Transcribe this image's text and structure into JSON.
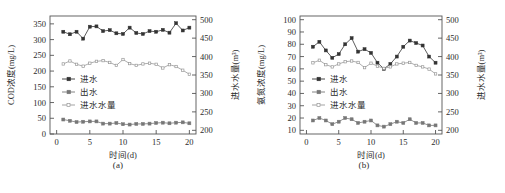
{
  "figure": {
    "panels": [
      {
        "caption": "(a)",
        "x_axis": {
          "label": "时间(d)",
          "ticks": [
            0,
            5,
            10,
            15,
            20
          ],
          "min": -1,
          "max": 21
        },
        "y_axis_left": {
          "label": "COD浓度(mg/L)",
          "ticks": [
            0,
            50,
            100,
            150,
            200,
            250,
            300,
            350
          ],
          "min": 0,
          "max": 375
        },
        "y_axis_right": {
          "label": "进水水量(m³)",
          "ticks": [
            200,
            250,
            300,
            350,
            400,
            450,
            500
          ],
          "min": 190,
          "max": 510
        },
        "legend": [
          {
            "label": "进水",
            "marker": "filled-square",
            "color": "#333333"
          },
          {
            "label": "出水",
            "marker": "filled-square",
            "color": "#777777"
          },
          {
            "label": "进水水量",
            "marker": "line-marker",
            "color": "#999999"
          }
        ],
        "chart_data": {
          "type": "line",
          "title": "",
          "xlabel": "时间(d)",
          "ylabel": "COD浓度(mg/L)",
          "ylabel_right": "进水水量(m³)",
          "xlim": [
            -1,
            21
          ],
          "ylim": [
            0,
            375
          ],
          "ylim_right": [
            190,
            510
          ],
          "grid": false,
          "legend_position": "center-left",
          "x": [
            1,
            2,
            3,
            4,
            5,
            6,
            7,
            8,
            9,
            10,
            11,
            12,
            13,
            14,
            15,
            16,
            17,
            18,
            19,
            20
          ],
          "series": [
            {
              "name": "进水",
              "axis": "left",
              "unit": "mg/L",
              "color": "#333333",
              "values": [
                325,
                317,
                325,
                303,
                341,
                342,
                327,
                330,
                320,
                318,
                338,
                321,
                318,
                327,
                325,
                331,
                322,
                352,
                329,
                338
              ]
            },
            {
              "name": "出水",
              "axis": "left",
              "unit": "mg/L",
              "color": "#777777",
              "values": [
                46,
                42,
                38,
                39,
                40,
                40,
                33,
                33,
                35,
                31,
                30,
                32,
                32,
                33,
                35,
                36,
                34,
                36,
                37,
                34
              ]
            },
            {
              "name": "进水水量",
              "axis": "right",
              "unit": "m³",
              "color": "#999999",
              "values": [
                380,
                388,
                379,
                374,
                382,
                387,
                389,
                384,
                376,
                392,
                381,
                376,
                380,
                382,
                379,
                369,
                378,
                373,
                363,
                352
              ]
            }
          ]
        }
      },
      {
        "caption": "(b)",
        "x_axis": {
          "label": "时间(d)",
          "ticks": [
            0,
            5,
            10,
            15,
            20
          ],
          "min": -1,
          "max": 21
        },
        "y_axis_left": {
          "label": "氨氮浓度(mg/L)",
          "ticks": [
            10,
            20,
            30,
            40,
            50,
            60,
            70,
            80,
            90,
            100
          ],
          "min": 7,
          "max": 103
        },
        "y_axis_right": {
          "label": "进水水量(m³)",
          "ticks": [
            200,
            250,
            300,
            350,
            400,
            450,
            500
          ],
          "min": 190,
          "max": 510
        },
        "legend": [
          {
            "label": "进水",
            "marker": "filled-square",
            "color": "#333333"
          },
          {
            "label": "出水",
            "marker": "filled-square",
            "color": "#777777"
          },
          {
            "label": "进水水量",
            "marker": "line-marker",
            "color": "#999999"
          }
        ],
        "chart_data": {
          "type": "line",
          "title": "",
          "xlabel": "时间(d)",
          "ylabel": "氨氮浓度(mg/L)",
          "ylabel_right": "进水水量(m³)",
          "xlim": [
            -1,
            21
          ],
          "ylim": [
            7,
            103
          ],
          "ylim_right": [
            190,
            510
          ],
          "grid": false,
          "legend_position": "center-left",
          "x": [
            1,
            2,
            3,
            4,
            5,
            6,
            7,
            8,
            9,
            10,
            11,
            12,
            13,
            14,
            15,
            16,
            17,
            18,
            19,
            20
          ],
          "series": [
            {
              "name": "进水",
              "axis": "left",
              "unit": "mg/L",
              "color": "#333333",
              "values": [
                78,
                82,
                75,
                69,
                72,
                80,
                85,
                74,
                76,
                73,
                65,
                60,
                64,
                70,
                78,
                83,
                81,
                79,
                70,
                65
              ]
            },
            {
              "name": "出水",
              "axis": "left",
              "unit": "mg/L",
              "color": "#777777",
              "values": [
                18,
                20,
                18,
                15,
                17,
                20,
                19,
                16,
                17,
                18,
                14,
                13,
                15,
                17,
                16,
                19,
                16,
                16,
                14,
                14
              ]
            },
            {
              "name": "进水水量",
              "axis": "right",
              "unit": "m³",
              "color": "#999999",
              "values": [
                383,
                390,
                378,
                372,
                380,
                386,
                388,
                384,
                370,
                382,
                374,
                368,
                372,
                380,
                382,
                384,
                376,
                372,
                366,
                353
              ]
            }
          ]
        }
      }
    ]
  }
}
